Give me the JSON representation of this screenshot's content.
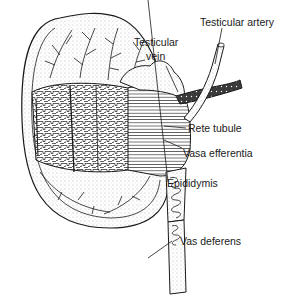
{
  "diagram": {
    "labels": {
      "testicular_artery": "Testicular artery",
      "testicular_vein_line1": "Testicular",
      "testicular_vein_line2": "vein",
      "rete_tubule": "Rete tubule",
      "vasa_efferentia": "Vasa efferentia",
      "epididymis": "Epididymis",
      "vas_deferens": "Vas deferens"
    },
    "colors": {
      "ink": "#1a1a1a",
      "background": "#ffffff",
      "stipple": "#9a9a9a"
    }
  }
}
